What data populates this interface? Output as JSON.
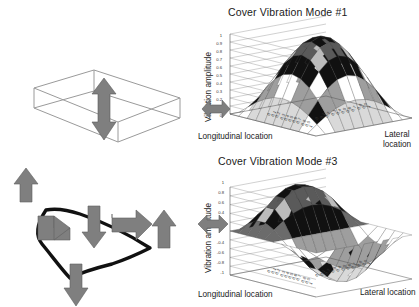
{
  "figure": {
    "caption": "",
    "accent_color": "#808080",
    "line_color": "#1a1a1a"
  },
  "diagrams": {
    "box": {
      "name": "open-box-wireframe",
      "arrow": "double-headed-vertical-arrow"
    },
    "plate": {
      "name": "deformed-plate-outline",
      "arrows": [
        {
          "id": "arrow-up-left",
          "direction": "up"
        },
        {
          "id": "arrow-right-left",
          "direction": "right"
        },
        {
          "id": "arrow-down-center",
          "direction": "down"
        },
        {
          "id": "arrow-right-center",
          "direction": "right"
        },
        {
          "id": "arrow-up-right",
          "direction": "up"
        },
        {
          "id": "arrow-down-bottom",
          "direction": "down"
        }
      ]
    }
  },
  "charts": [
    {
      "id": "mode1",
      "title": "Cover Vibration Mode #1",
      "ylabel": "Vibration amplitude",
      "xlabel": "Longitudinal location",
      "zlabel": "Lateral location",
      "zlabel_lines": [
        "Lateral",
        "location"
      ],
      "yticks": [
        "1",
        "0.9",
        "0.8",
        "0.7",
        "0.6",
        "0.5",
        "0.4",
        "0.3",
        "0.2",
        "0.1",
        "0"
      ],
      "xticks": [
        "0",
        "0.1",
        "0.2",
        "0.3",
        "0.4",
        "0.5",
        "0.6",
        "0.7",
        "0.8",
        "0.9",
        "1"
      ],
      "zticks": [
        "0",
        "0.1",
        "0.2",
        "0.3",
        "0.4",
        "0.5",
        "0.6",
        "0.7",
        "0.8",
        "0.9",
        "1"
      ]
    },
    {
      "id": "mode3",
      "title": "Cover Vibration Mode #3",
      "ylabel": "Vibration amplitude",
      "xlabel": "Longitudinal location",
      "zlabel": "Lateral location",
      "zlabel_lines": [
        "Lateral location"
      ],
      "yticks": [
        "1",
        "0.8",
        "0.6",
        "0.4",
        "0.2",
        "",
        "-0.4",
        "-0.6",
        "-0.8",
        "-1"
      ],
      "xticks": [
        "0",
        "0.1",
        "0.2",
        "0.3",
        "0.4",
        "0.5",
        "0.6",
        "0.7",
        "0.8",
        "0.9",
        "1"
      ],
      "zticks": [
        "0",
        "0.1",
        "0.2",
        "0.3",
        "0.4",
        "0.5",
        "0.6",
        "0.7",
        "0.8",
        "0.9",
        "1"
      ]
    }
  ],
  "chart_data": [
    {
      "id": "mode1",
      "type": "surface",
      "title": "Cover Vibration Mode #1",
      "xlabel": "Longitudinal location",
      "ylabel": "Vibration amplitude",
      "zlabel": "Lateral location",
      "zlim": [
        0,
        1
      ],
      "xlim": [
        0,
        1
      ],
      "ylim": [
        0,
        1
      ],
      "grid": true,
      "legend": "none",
      "formula": "sin(pi*x) * sin(pi*y)",
      "description": "Single dome, first bending mode, peak amplitude 1 at plate centre, zero at all edges.",
      "contour_bands": 10,
      "x": [
        0,
        0.1,
        0.2,
        0.3,
        0.4,
        0.5,
        0.6,
        0.7,
        0.8,
        0.9,
        1
      ],
      "y": [
        0,
        0.1,
        0.2,
        0.3,
        0.4,
        0.5,
        0.6,
        0.7,
        0.8,
        0.9,
        1
      ],
      "z": [
        [
          0,
          0,
          0,
          0,
          0,
          0,
          0,
          0,
          0,
          0,
          0
        ],
        [
          0,
          0.095,
          0.181,
          0.249,
          0.294,
          0.309,
          0.294,
          0.249,
          0.181,
          0.095,
          0
        ],
        [
          0,
          0.181,
          0.345,
          0.474,
          0.559,
          0.588,
          0.559,
          0.474,
          0.345,
          0.181,
          0
        ],
        [
          0,
          0.249,
          0.474,
          0.654,
          0.769,
          0.809,
          0.769,
          0.654,
          0.474,
          0.249,
          0
        ],
        [
          0,
          0.294,
          0.559,
          0.769,
          0.905,
          0.951,
          0.905,
          0.769,
          0.559,
          0.294,
          0
        ],
        [
          0,
          0.309,
          0.588,
          0.809,
          0.951,
          1.0,
          0.951,
          0.809,
          0.588,
          0.309,
          0
        ],
        [
          0,
          0.294,
          0.559,
          0.769,
          0.905,
          0.951,
          0.905,
          0.769,
          0.559,
          0.294,
          0
        ],
        [
          0,
          0.249,
          0.474,
          0.654,
          0.769,
          0.809,
          0.769,
          0.654,
          0.474,
          0.249,
          0
        ],
        [
          0,
          0.181,
          0.345,
          0.474,
          0.559,
          0.588,
          0.559,
          0.474,
          0.345,
          0.181,
          0
        ],
        [
          0,
          0.095,
          0.181,
          0.249,
          0.294,
          0.309,
          0.294,
          0.249,
          0.181,
          0.095,
          0
        ],
        [
          0,
          0,
          0,
          0,
          0,
          0,
          0,
          0,
          0,
          0,
          0
        ]
      ]
    },
    {
      "id": "mode3",
      "type": "surface",
      "title": "Cover Vibration Mode #3",
      "xlabel": "Longitudinal location",
      "ylabel": "Vibration amplitude",
      "zlabel": "Lateral location",
      "zlim": [
        -1,
        1
      ],
      "xlim": [
        0,
        1
      ],
      "ylim": [
        0,
        1
      ],
      "grid": true,
      "legend": "none",
      "formula": "sin(2*pi*x) * sin(pi*y)",
      "description": "Two antisymmetric lobes: positive peak +1 and negative trough -1, nodal line across the middle.",
      "contour_bands": 10,
      "x": [
        0,
        0.1,
        0.2,
        0.3,
        0.4,
        0.5,
        0.6,
        0.7,
        0.8,
        0.9,
        1
      ],
      "y": [
        0,
        0.1,
        0.2,
        0.3,
        0.4,
        0.5,
        0.6,
        0.7,
        0.8,
        0.9,
        1
      ],
      "z": [
        [
          0,
          0,
          0,
          0,
          0,
          0,
          0,
          0,
          0,
          0,
          0
        ],
        [
          0,
          0.181,
          0.294,
          0.294,
          0.181,
          0,
          -0.181,
          -0.294,
          -0.294,
          -0.181,
          0
        ],
        [
          0,
          0.345,
          0.559,
          0.559,
          0.345,
          0,
          -0.345,
          -0.559,
          -0.559,
          -0.345,
          0
        ],
        [
          0,
          0.474,
          0.769,
          0.769,
          0.474,
          0,
          -0.474,
          -0.769,
          -0.769,
          -0.474,
          0
        ],
        [
          0,
          0.559,
          0.905,
          0.905,
          0.559,
          0,
          -0.559,
          -0.905,
          -0.905,
          -0.559,
          0
        ],
        [
          0,
          0.588,
          0.951,
          0.951,
          0.588,
          0,
          -0.588,
          -0.951,
          -0.951,
          -0.588,
          0
        ],
        [
          0,
          0.559,
          0.905,
          0.905,
          0.559,
          0,
          -0.559,
          -0.905,
          -0.905,
          -0.559,
          0
        ],
        [
          0,
          0.474,
          0.769,
          0.769,
          0.474,
          0,
          -0.474,
          -0.769,
          -0.769,
          -0.474,
          0
        ],
        [
          0,
          0.345,
          0.559,
          0.559,
          0.345,
          0,
          -0.345,
          -0.559,
          -0.559,
          -0.345,
          0
        ],
        [
          0,
          0.181,
          0.294,
          0.294,
          0.181,
          0,
          -0.181,
          -0.294,
          -0.294,
          -0.181,
          0
        ],
        [
          0,
          0,
          0,
          0,
          0,
          0,
          0,
          0,
          0,
          0,
          0
        ]
      ]
    }
  ]
}
